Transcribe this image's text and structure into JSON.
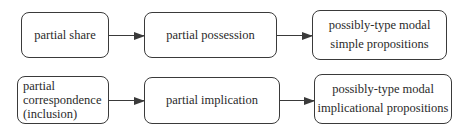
{
  "diagram": {
    "rows": [
      {
        "nodes": [
          {
            "id": "partial-share",
            "lines": [
              "partial share"
            ]
          },
          {
            "id": "partial-possession",
            "lines": [
              "partial possession"
            ]
          },
          {
            "id": "possibly-type-modal-simple",
            "lines": [
              "possibly-type modal",
              "simple propositions"
            ]
          }
        ]
      },
      {
        "nodes": [
          {
            "id": "partial-correspondence",
            "lines": [
              "partial",
              "correspondence",
              "(inclusion)"
            ]
          },
          {
            "id": "partial-implication",
            "lines": [
              "partial implication"
            ]
          },
          {
            "id": "possibly-type-modal-implicational",
            "lines": [
              "possibly-type modal",
              "implicational propositions"
            ]
          }
        ]
      }
    ],
    "edges": [
      {
        "from": "partial-share",
        "to": "partial-possession"
      },
      {
        "from": "partial-possession",
        "to": "possibly-type-modal-simple"
      },
      {
        "from": "partial-correspondence",
        "to": "partial-implication"
      },
      {
        "from": "partial-implication",
        "to": "possibly-type-modal-implicational"
      }
    ]
  }
}
